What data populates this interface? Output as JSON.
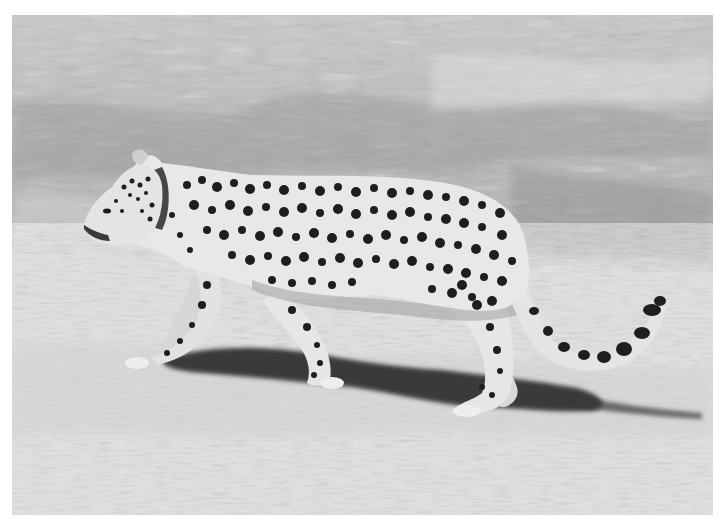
{
  "image": {
    "subject": "leopard walking",
    "description": "Grayscale photograph of a spotted leopard walking left across bare dry ground, with tall dry grass in the background and a shadow cast beneath it",
    "color_mode": "grayscale",
    "colors": {
      "grass_light": "#d8d8d8",
      "grass_mid": "#a8a8a8",
      "grass_dark": "#6e6e6e",
      "ground": "#c4c4c4",
      "ground_light": "#dadada",
      "leopard_fur": "#e6e6e6",
      "spots": "#1e1e1e",
      "shadow": "#2e2e2e",
      "margin": "#ffffff"
    },
    "frame": {
      "x": 12,
      "y": 15,
      "width": 701,
      "height": 500
    }
  }
}
